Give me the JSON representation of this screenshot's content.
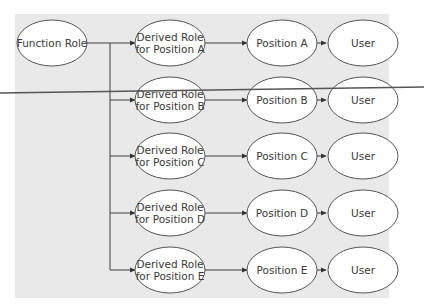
{
  "diagram": {
    "background_color": "#e9e9e9",
    "line_color": "#3c3c3c",
    "root": {
      "label": "Function Role"
    },
    "rows": [
      {
        "derived": [
          "Derived Role",
          "for Position A"
        ],
        "position": "Position A",
        "user": "User"
      },
      {
        "derived": [
          "Derived Role",
          "for Position B"
        ],
        "position": "Position B",
        "user": "User"
      },
      {
        "derived": [
          "Derived Role",
          "for Position C"
        ],
        "position": "Position C",
        "user": "User"
      },
      {
        "derived": [
          "Derived Role",
          "for Position D"
        ],
        "position": "Position D",
        "user": "User"
      },
      {
        "derived": [
          "Derived Role",
          "for Position E"
        ],
        "position": "Position E",
        "user": "User"
      }
    ]
  }
}
